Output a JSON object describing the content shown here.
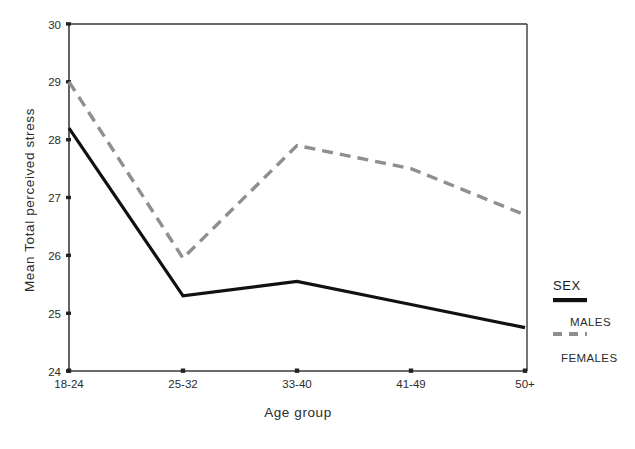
{
  "chart_data": {
    "type": "line",
    "title": "",
    "xlabel": "Age group",
    "ylabel": "Mean Total perceived  stress",
    "categories": [
      "18-24",
      "25-32",
      "33-40",
      "41-49",
      "50+"
    ],
    "series": [
      {
        "name": "MALES",
        "style": "solid",
        "color": "#111111",
        "values": [
          28.2,
          25.3,
          25.55,
          25.15,
          24.75
        ]
      },
      {
        "name": "FEMALES",
        "style": "dashed",
        "color": "#8f8f8f",
        "values": [
          29.0,
          25.95,
          27.9,
          27.5,
          26.7
        ]
      }
    ],
    "ylim": [
      24,
      30
    ],
    "yticks": [
      "24",
      "25",
      "26",
      "27",
      "28",
      "29",
      "30"
    ],
    "grid": false,
    "legend": {
      "title": "SEX",
      "position": "right",
      "entries": [
        {
          "label": "MALES",
          "marker": "solid-line"
        },
        {
          "label": "FEMALES",
          "marker": "dashed-line"
        }
      ]
    }
  },
  "axes": {
    "y_title": "Mean Total perceived  stress",
    "x_title": "Age group"
  }
}
